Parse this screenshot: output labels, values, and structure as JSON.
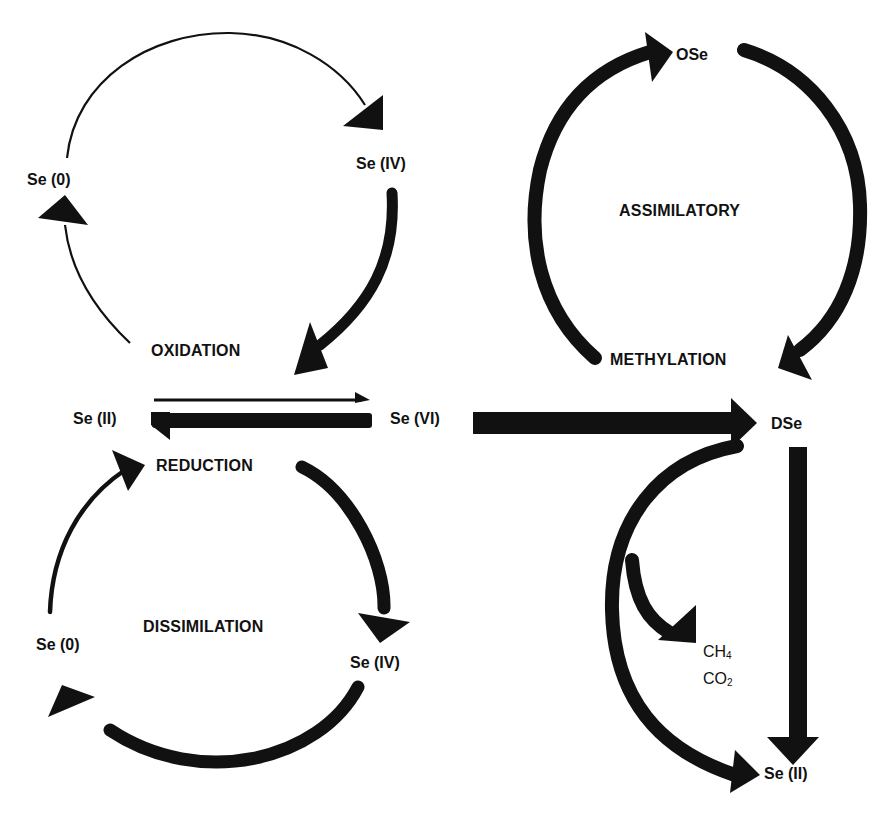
{
  "diagram": {
    "colors": {
      "ink": "#111111",
      "background": "#ffffff"
    },
    "processes": {
      "oxidation": "OXIDATION",
      "reduction": "REDUCTION",
      "dissimilation": "DISSIMILATION",
      "assimilatory": "ASSIMILATORY",
      "methylation": "METHYLATION"
    },
    "nodes": {
      "ox_se0": "Se (0)",
      "ox_se4": "Se (IV)",
      "se2_left": "Se (II)",
      "se6": "Se (VI)",
      "dis_se0": "Se (0)",
      "dis_se4": "Se (IV)",
      "ose": "OSe",
      "dse": "DSe",
      "ch4_base": "CH",
      "ch4_sub": "4",
      "co2_base": "CO",
      "co2_sub": "2",
      "se2_right": "Se (II)"
    },
    "edges": [
      {
        "from": "Se (II)",
        "to": "Se (0)",
        "cycle": "oxidation",
        "weight": "thin"
      },
      {
        "from": "Se (0)",
        "to": "Se (IV)",
        "cycle": "oxidation",
        "weight": "thin"
      },
      {
        "from": "Se (IV)",
        "to": "OXIDATION/Se (VI)",
        "cycle": "oxidation",
        "weight": "thick"
      },
      {
        "from": "Se (II)",
        "to": "Se (VI)",
        "weight": "thin"
      },
      {
        "from": "Se (VI)",
        "to": "Se (II)",
        "weight": "thick"
      },
      {
        "from": "REDUCTION",
        "to": "Se (IV)",
        "cycle": "dissimilation",
        "weight": "thick"
      },
      {
        "from": "Se (IV)",
        "to": "Se (0)",
        "cycle": "dissimilation",
        "weight": "thick"
      },
      {
        "from": "Se (0)",
        "to": "Se (II)",
        "cycle": "dissimilation",
        "weight": "medium"
      },
      {
        "from": "Se (VI)",
        "to": "DSe",
        "weight": "thick"
      },
      {
        "from": "METHYLATION",
        "to": "OSe",
        "cycle": "assimilatory",
        "weight": "thick"
      },
      {
        "from": "OSe",
        "to": "DSe",
        "cycle": "assimilatory",
        "weight": "thick"
      },
      {
        "from": "DSe",
        "to": "CH4 / CO2",
        "weight": "thick"
      },
      {
        "from": "DSe",
        "to": "Se (II)",
        "weight": "thick",
        "path": "curved"
      },
      {
        "from": "DSe",
        "to": "Se (II)",
        "weight": "thick",
        "path": "straight"
      }
    ]
  }
}
